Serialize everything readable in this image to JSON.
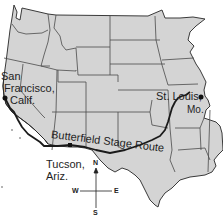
{
  "map": {
    "title": "Butterfield Stage Route",
    "route_label": "Butterfield Stage Route",
    "colors": {
      "land": "#d4d4d4",
      "border": "#3a3a3a",
      "route": "#1a1a1a",
      "water": "#ffffff",
      "text": "#1e1e1e"
    },
    "cities": [
      {
        "name_line1": "San",
        "name_line2": "Francisco,",
        "name_line3": "Calif."
      },
      {
        "name_line1": "St. Louis,",
        "name_line2": "Mo."
      },
      {
        "name_line1": "Tucson,",
        "name_line2": "Ariz."
      }
    ],
    "compass": {
      "n": "N",
      "s": "S",
      "e": "E",
      "w": "W"
    }
  }
}
